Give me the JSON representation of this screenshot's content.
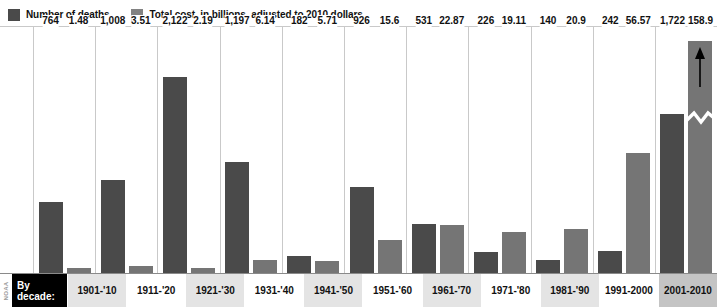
{
  "legend": {
    "items": [
      {
        "label": "Number of deaths",
        "color": "#4a4a4a",
        "icon": "legend-swatch-icon"
      },
      {
        "label": "Total cost, in billions, adjusted to 2010 dollars",
        "color": "#828282",
        "icon": "legend-swatch-icon"
      }
    ]
  },
  "axis": {
    "title_line1": "By",
    "title_line2": "decade:",
    "credit": "NOAA"
  },
  "chart_data": {
    "type": "bar",
    "title": "",
    "subtitle": "",
    "xlabel": "By decade:",
    "ylabel": "",
    "grid": false,
    "legend_position": "top-left",
    "categories": [
      "1901-'10",
      "1911-'20",
      "1921-'30",
      "1931-'40",
      "1941-'50",
      "1951-'60",
      "1961-'70",
      "1971-'80",
      "1981-'90",
      "1991-2000",
      "2001-2010"
    ],
    "series": [
      {
        "name": "Number of deaths",
        "color": "#4a4a4a",
        "values": [
          764,
          1008,
          2122,
          1197,
          182,
          926,
          531,
          226,
          140,
          242,
          1722
        ],
        "labels": [
          "764",
          "1,008",
          "2,122",
          "1,197",
          "182",
          "926",
          "531",
          "226",
          "140",
          "242",
          "1,722"
        ]
      },
      {
        "name": "Total cost, in billions, adjusted to 2010 dollars",
        "color": "#757575",
        "values": [
          1.48,
          3.51,
          2.19,
          6.14,
          5.71,
          15.6,
          22.87,
          19.11,
          20.9,
          56.57,
          158.9
        ],
        "labels": [
          "1.48",
          "3.51",
          "2.19",
          "6.14",
          "5.71",
          "15.6",
          "22.87",
          "19.11",
          "20.9",
          "56.57",
          "158.9"
        ]
      }
    ],
    "annotations": [
      {
        "category": "2001-2010",
        "series": "Total cost, in billions, adjusted to 2010 dollars",
        "type": "axis-break-arrow",
        "note": "Bar truncated with zigzag break and upward arrow"
      }
    ]
  }
}
